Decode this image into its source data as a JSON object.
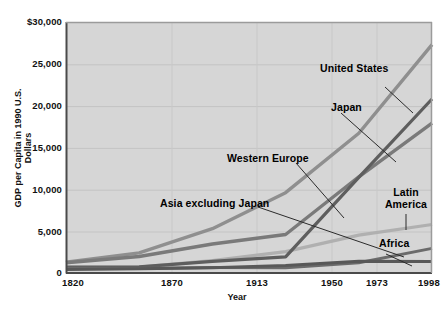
{
  "chart_data": {
    "type": "line",
    "title": "",
    "xlabel": "Year",
    "ylabel": "GDP per Capita in 1990 U.S. Dollars",
    "x": [
      1820,
      1870,
      1913,
      1950,
      1973,
      1998
    ],
    "xticklabels": [
      "1820",
      "1870",
      "1913",
      "1950",
      "1973",
      "1998"
    ],
    "yticklabels": [
      "$30,000",
      "25,000",
      "20,000",
      "15,000",
      "10,000",
      "5,000",
      "0"
    ],
    "yticks": [
      30000,
      25000,
      20000,
      15000,
      10000,
      5000,
      0
    ],
    "ylim": [
      0,
      30000
    ],
    "xlim": [
      1820,
      1998
    ],
    "grid": true,
    "legend": "inline-annotations",
    "series": [
      {
        "name": "United States",
        "values": [
          1300,
          2400,
          5300,
          9600,
          16700,
          27300
        ],
        "color": "#8f8f8f"
      },
      {
        "name": "Japan",
        "values": [
          700,
          740,
          1390,
          1930,
          11430,
          20800
        ],
        "color": "#5e5e5e"
      },
      {
        "name": "Western Europe",
        "values": [
          1230,
          1970,
          3470,
          4600,
          11500,
          17900
        ],
        "color": "#7a7a7a"
      },
      {
        "name": "Latin America",
        "values": [
          690,
          700,
          1480,
          2550,
          4530,
          5800
        ],
        "color": "#b0b0b0"
      },
      {
        "name": "Asia excluding Japan",
        "values": [
          580,
          550,
          660,
          640,
          1230,
          2940
        ],
        "color": "#6b6b6b"
      },
      {
        "name": "Africa",
        "values": [
          420,
          500,
          640,
          890,
          1410,
          1370
        ],
        "color": "#585858"
      }
    ]
  },
  "annotations": [
    {
      "label": "United States",
      "name": "label-united-states"
    },
    {
      "label": "Japan",
      "name": "label-japan"
    },
    {
      "label": "Western Europe",
      "name": "label-western-europe"
    },
    {
      "label": "Asia excluding Japan",
      "name": "label-asia-excluding-japan"
    },
    {
      "label": "Latin",
      "name": "label-latin-america-line1"
    },
    {
      "label": "America",
      "name": "label-latin-america-line2"
    },
    {
      "label": "Africa",
      "name": "label-africa"
    }
  ],
  "colors": {
    "plot_background": "#d6d6d6",
    "grid": "#c4c4c4",
    "axis": "#4a4a4a",
    "text": "#111111"
  }
}
